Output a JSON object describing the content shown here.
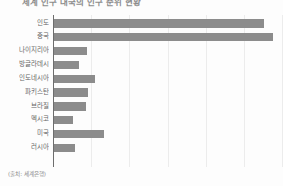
{
  "chart_data": {
    "type": "bar",
    "orientation": "horizontal",
    "title": "세계 인구 대국의 인구 순위 현황",
    "xlabel": "",
    "ylabel": "",
    "categories": [
      "인도",
      "중국",
      "나이지리아",
      "방글라데시",
      "인도네시아",
      "파키스탄",
      "브라질",
      "멕시코",
      "미국",
      "러시아"
    ],
    "values": [
      1380,
      1440,
      220,
      170,
      275,
      230,
      215,
      130,
      335,
      145
    ],
    "xlim": [
      0,
      1500
    ],
    "grid": true,
    "gridline_count": 6,
    "legend": "none",
    "bar_color": "#8c8c8c",
    "background_color": "#fdfdfd",
    "axis_color": "#6d6d6d",
    "gridline_color": "#ececec"
  },
  "source": {
    "note": "(출처: 세계은행)"
  }
}
